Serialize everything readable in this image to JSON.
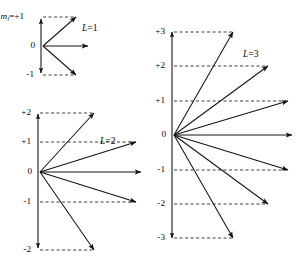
{
  "figure": {
    "background_color": "#ffffff",
    "line_color": "#141414",
    "dash_color": "#2a2a2a"
  },
  "panels": [
    {
      "id": "panel-l1",
      "group_label": "L=1",
      "group_label_symbol": "L",
      "group_label_value": "=1",
      "group_label_x": 82,
      "group_label_y": 29,
      "origin_x": 41,
      "origin_y": 46,
      "axis_top_y": 15,
      "axis_bottom_y": 77,
      "ml_prefix": "m",
      "ml_subscript": "l",
      "ml_suffix": "=+1",
      "levels": [
        {
          "label": "+1",
          "m": 1,
          "y": 17,
          "tip_x": 76,
          "tip_y": 17,
          "dash_from_x": 43,
          "dash_to_x": 76,
          "has_vector": true,
          "label_x": 33
        },
        {
          "label": "0",
          "m": 0,
          "y": 46,
          "tip_x": 88,
          "tip_y": 46,
          "dash_from_x": 0,
          "dash_to_x": 0,
          "has_vector": true,
          "label_x": 35
        },
        {
          "label": "-1",
          "m": -1,
          "y": 75,
          "tip_x": 76,
          "tip_y": 75,
          "dash_from_x": 43,
          "dash_to_x": 76,
          "has_vector": true,
          "label_x": 34
        }
      ]
    },
    {
      "id": "panel-l2",
      "group_label": "L=2",
      "group_label_symbol": "L",
      "group_label_value": "=2",
      "group_label_x": 100,
      "group_label_y": 142,
      "origin_x": 38,
      "origin_y": 172,
      "axis_top_y": 110,
      "axis_bottom_y": 252,
      "ml_prefix": "",
      "ml_subscript": "",
      "ml_suffix": "",
      "levels": [
        {
          "label": "+2",
          "m": 2,
          "y": 113,
          "tip_x": 94,
          "tip_y": 113,
          "dash_from_x": 40,
          "dash_to_x": 94,
          "has_vector": true,
          "label_x": 31
        },
        {
          "label": "+1",
          "m": 1,
          "y": 142,
          "tip_x": 136,
          "tip_y": 142,
          "dash_from_x": 40,
          "dash_to_x": 136,
          "has_vector": true,
          "label_x": 31
        },
        {
          "label": "0",
          "m": 0,
          "y": 172,
          "tip_x": 141,
          "tip_y": 172,
          "dash_from_x": 0,
          "dash_to_x": 0,
          "has_vector": true,
          "label_x": 32
        },
        {
          "label": "-1",
          "m": -1,
          "y": 202,
          "tip_x": 136,
          "tip_y": 202,
          "dash_from_x": 40,
          "dash_to_x": 136,
          "has_vector": true,
          "label_x": 31
        },
        {
          "label": "-2",
          "m": -2,
          "y": 250,
          "tip_x": 94,
          "tip_y": 250,
          "dash_from_x": 40,
          "dash_to_x": 94,
          "has_vector": true,
          "label_x": 31
        }
      ]
    },
    {
      "id": "panel-l3",
      "group_label": "L=3",
      "group_label_symbol": "L",
      "group_label_value": "=3",
      "group_label_x": 243,
      "group_label_y": 55,
      "origin_x": 172,
      "origin_y": 135,
      "axis_top_y": 28,
      "axis_bottom_y": 242,
      "ml_prefix": "",
      "ml_subscript": "",
      "ml_suffix": "",
      "levels": [
        {
          "label": "+3",
          "m": 3,
          "y": 32,
          "tip_x": 233,
          "tip_y": 32,
          "dash_from_x": 174,
          "dash_to_x": 233,
          "has_vector": true,
          "label_x": 165
        },
        {
          "label": "+2",
          "m": 2,
          "y": 66,
          "tip_x": 268,
          "tip_y": 66,
          "dash_from_x": 174,
          "dash_to_x": 268,
          "has_vector": true,
          "label_x": 165
        },
        {
          "label": "+1",
          "m": 1,
          "y": 101,
          "tip_x": 288,
          "tip_y": 101,
          "dash_from_x": 174,
          "dash_to_x": 288,
          "has_vector": true,
          "label_x": 165
        },
        {
          "label": "0",
          "m": 0,
          "y": 135,
          "tip_x": 292,
          "tip_y": 135,
          "dash_from_x": 0,
          "dash_to_x": 0,
          "has_vector": true,
          "label_x": 166
        },
        {
          "label": "-1",
          "m": -1,
          "y": 170,
          "tip_x": 288,
          "tip_y": 170,
          "dash_from_x": 174,
          "dash_to_x": 288,
          "has_vector": true,
          "label_x": 165
        },
        {
          "label": "-2",
          "m": -2,
          "y": 204,
          "tip_x": 268,
          "tip_y": 204,
          "dash_from_x": 174,
          "dash_to_x": 268,
          "has_vector": true,
          "label_x": 165
        },
        {
          "label": "-3",
          "m": -3,
          "y": 238,
          "tip_x": 233,
          "tip_y": 238,
          "dash_from_x": 174,
          "dash_to_x": 233,
          "has_vector": true,
          "label_x": 165
        }
      ]
    }
  ]
}
